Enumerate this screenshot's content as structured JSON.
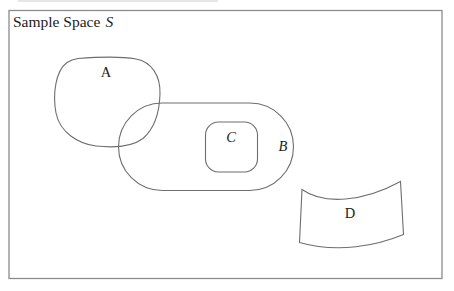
{
  "diagram": {
    "title": {
      "text": "Sample Space",
      "symbol": "S"
    },
    "regions": [
      {
        "id": "A",
        "label": "A",
        "shape": "rounded-blob",
        "label_style": "upright",
        "overlaps": "B"
      },
      {
        "id": "B",
        "label": "B",
        "shape": "stadium",
        "label_style": "italic",
        "contains": "C"
      },
      {
        "id": "C",
        "label": "C",
        "shape": "rounded-rect",
        "label_style": "italic",
        "inside": "B"
      },
      {
        "id": "D",
        "label": "D",
        "shape": "wavy-flag",
        "label_style": "upright",
        "disjoint": true
      }
    ],
    "colors": {
      "background": "#ffffff",
      "border": "#8c8c8c",
      "line": "#6e6e6e",
      "text": "#1c1c1c"
    }
  }
}
